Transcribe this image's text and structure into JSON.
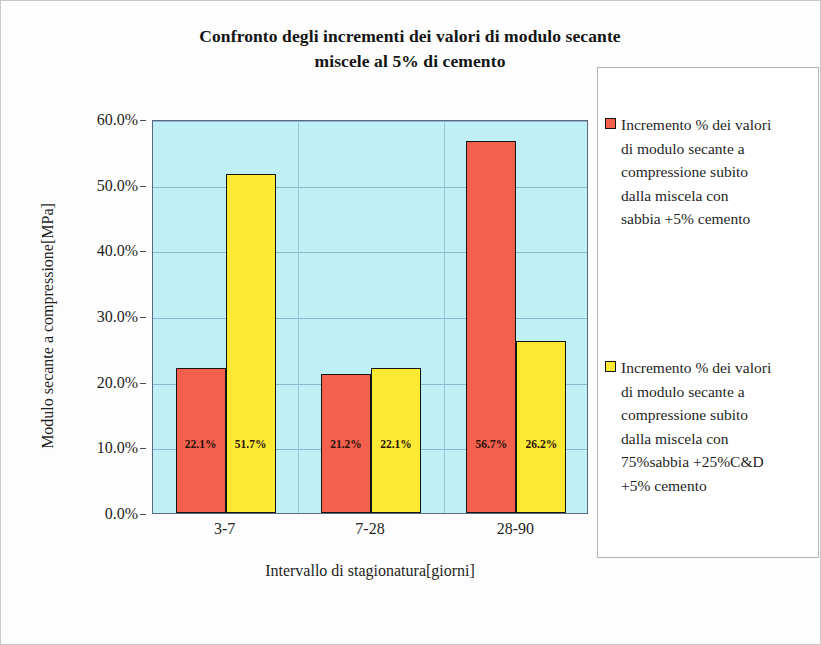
{
  "chart_data": {
    "type": "bar",
    "title": "Confronto degli incrementi dei valori di modulo secante miscele al 5% di cemento",
    "title_lines": [
      "Confronto degli incrementi dei valori di modulo secante",
      "miscele al 5% di cemento"
    ],
    "xlabel": "Intervallo di stagionatura[giorni]",
    "ylabel": "Modulo secante a compressione[MPa]",
    "categories": [
      "3-7",
      "7-28",
      "28-90"
    ],
    "ylim": [
      0,
      60
    ],
    "ytick_labels": [
      "0.0%",
      "10.0%",
      "20.0%",
      "30.0%",
      "40.0%",
      "50.0%",
      "60.0%"
    ],
    "ytick_values": [
      0,
      10,
      20,
      30,
      40,
      50,
      60
    ],
    "grid": true,
    "legend_position": "right",
    "plot_background": "#bff0f5",
    "series": [
      {
        "name": "Incremento % dei valori di modulo secante a compressione subito dalla miscela con sabbia +5% cemento",
        "color": "#f4604e",
        "values": [
          22.1,
          21.2,
          56.7
        ],
        "value_labels": [
          "22.1%",
          "21.2%",
          "56.7%"
        ]
      },
      {
        "name": "Incremento % dei valori di modulo secante a compressione subito dalla miscela con 75%sabbia +25%C&D +5% cemento",
        "color": "#fce933",
        "values": [
          51.7,
          22.1,
          26.2
        ],
        "value_labels": [
          "51.7%",
          "22.1%",
          "26.2%"
        ]
      }
    ]
  },
  "legend": {
    "entries": [
      {
        "color": "#f4604e",
        "lines": [
          "Incremento % dei valori",
          "di modulo secante a",
          "compressione subito",
          "dalla miscela con",
          "sabbia +5% cemento"
        ]
      },
      {
        "color": "#fce933",
        "lines": [
          "Incremento % dei valori",
          "di modulo secante a",
          "compressione subito",
          "dalla miscela con",
          "75%sabbia +25%C&D",
          "+5% cemento"
        ]
      }
    ]
  }
}
